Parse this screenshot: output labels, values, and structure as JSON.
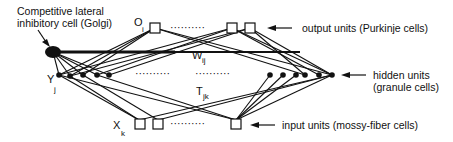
{
  "diagram": {
    "labels": {
      "golgi_line1": "Competitive lateral",
      "golgi_line2": "inhibitory cell (Golgi)",
      "output": "output units (Purkinje cells)",
      "hidden_line1": "hidden units",
      "hidden_line2": "(granule cells)",
      "input": "input units (mossy-fiber cells)"
    },
    "symbols": {
      "output_var": "O",
      "output_sub": "i",
      "hidden_var": "Y",
      "hidden_sub": "j",
      "input_var": "X",
      "input_sub": "k",
      "weight_out": "W",
      "weight_out_sub": "ij",
      "weight_in": "T",
      "weight_in_sub": "jk"
    },
    "ellipsis": "··········"
  }
}
